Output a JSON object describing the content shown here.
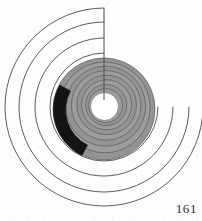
{
  "page": {
    "number_label": "161",
    "background_color": "#fdfdfb"
  },
  "figure": {
    "name": "archimedean-spiral-diagram",
    "center": {
      "x": 104,
      "y": 107
    },
    "colors": {
      "line": "#4a4a4a",
      "gray_fill": "#949494",
      "gray_fill_dark": "#8a8a8a",
      "black_fill": "#141414",
      "hole_fill": "#ffffff",
      "background": "#fdfdfb"
    },
    "center_hole": {
      "radius": 14,
      "fill": "#ffffff"
    },
    "radius_line": {
      "from": {
        "x": 104,
        "y": 8
      },
      "to": {
        "x": 104,
        "y": 107
      },
      "stroke_width": 1.0
    },
    "outer_spiral": {
      "description": "thin-line archimedean spiral turns",
      "turn_count": 3,
      "radii": [
        100,
        84,
        68
      ],
      "stroke_width": 0.9
    },
    "inner_spiral": {
      "description": "gray filled archimedean spiral band",
      "turn_count": 8,
      "outer_radius": 51,
      "inner_radius": 14,
      "band_pitch": 5.4,
      "stroke_width": 0.8
    },
    "black_segment": {
      "description": "black filled arc on outer gray band, left side",
      "start_angle_deg": 152,
      "end_angle_deg": 244,
      "outer_radius": 51,
      "inner_radius": 40
    }
  }
}
